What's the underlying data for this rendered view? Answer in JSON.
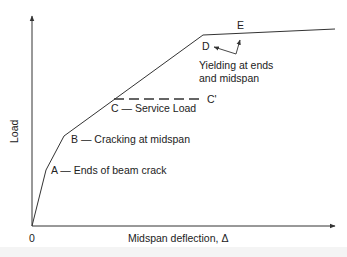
{
  "diagram": {
    "type": "load-deflection curve",
    "axes": {
      "y_label": "Load",
      "x_label": "Midspan deflection, Δ",
      "origin_label": "0"
    },
    "points": {
      "A": {
        "label": "A — Ends of beam crack"
      },
      "B": {
        "label": "B — Cracking at midspan"
      },
      "C": {
        "label": "C — Service Load"
      },
      "C_prime": {
        "label": "C'"
      },
      "D": {
        "label": "D"
      },
      "E": {
        "label": "E"
      }
    },
    "annotation": {
      "line1": "Yielding at ends",
      "line2": "and midspan"
    },
    "colors": {
      "line": "#333333",
      "text": "#222222",
      "background": "#ffffff"
    }
  }
}
